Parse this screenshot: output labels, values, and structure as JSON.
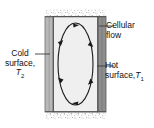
{
  "figure": {
    "type": "diagram",
    "width": 154,
    "height": 128
  },
  "labels": {
    "cellular_flow": {
      "line1": "Cellular",
      "line2": "flow",
      "leader": "horizontal-line-to-cavity-top-right"
    },
    "hot_surface": {
      "line1": "Hot",
      "line2_text": "surface,",
      "line2_symbol": "T",
      "line2_subscript": "1",
      "leader": "horizontal-line-to-right-wall"
    },
    "cold_surface": {
      "line1": "Cold",
      "line2": "surface,",
      "line3_symbol": "T",
      "line3_subscript": "2",
      "leader": "horizontal-line-to-left-wall"
    }
  },
  "diagram": {
    "cavity": {
      "fill": "#efefef",
      "outline": "#4a4a4a"
    },
    "left_wall": {
      "name": "cold-surface-wall",
      "fill": "#b9b9b9",
      "edge": "#6e6e6e"
    },
    "right_wall": {
      "name": "hot-surface-wall",
      "fill": "#8e8e8e",
      "edge": "#5a5a5a"
    },
    "insulation": {
      "name": "stippled-insulation-band",
      "position": "top-and-bottom",
      "fill": "#ffffff",
      "speckle": "#9a9a9a"
    },
    "flow_loop": {
      "name": "cellular-flow-ellipse",
      "stroke": "#1a1a1a",
      "direction": "clockwise",
      "arrow_count": 6,
      "arrow_positions": [
        "top",
        "upper-right",
        "lower-right",
        "bottom",
        "lower-left",
        "upper-left"
      ]
    },
    "leader_lines": {
      "stroke": "#3a3a3a"
    }
  }
}
